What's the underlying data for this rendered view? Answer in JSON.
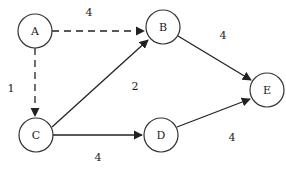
{
  "diagram": {
    "type": "directed-weighted-graph",
    "nodes": [
      {
        "id": "A",
        "label": "A",
        "cx": 35,
        "cy": 31
      },
      {
        "id": "B",
        "label": "B",
        "cx": 163,
        "cy": 27
      },
      {
        "id": "C",
        "label": "C",
        "cx": 36,
        "cy": 135
      },
      {
        "id": "D",
        "label": "D",
        "cx": 161,
        "cy": 135
      },
      {
        "id": "E",
        "label": "E",
        "cx": 267,
        "cy": 90
      }
    ],
    "edges": [
      {
        "from": "A",
        "to": "B",
        "weight": "4",
        "style": "dashed",
        "label_x": 89,
        "label_y": 12
      },
      {
        "from": "A",
        "to": "C",
        "weight": "1",
        "style": "dashed",
        "label_x": 11,
        "label_y": 88
      },
      {
        "from": "C",
        "to": "B",
        "weight": "2",
        "style": "solid",
        "label_x": 135,
        "label_y": 86
      },
      {
        "from": "B",
        "to": "E",
        "weight": "4",
        "style": "solid",
        "label_x": 223,
        "label_y": 35
      },
      {
        "from": "C",
        "to": "D",
        "weight": "4",
        "style": "solid",
        "label_x": 98,
        "label_y": 157
      },
      {
        "from": "D",
        "to": "E",
        "weight": "4",
        "style": "solid",
        "label_x": 232,
        "label_y": 137
      }
    ],
    "node_radius": 17,
    "colors": {
      "stroke": "#333333",
      "text": "#222222",
      "background": "#ffffff"
    }
  }
}
